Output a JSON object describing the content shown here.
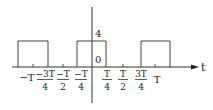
{
  "diagram": {
    "type": "periodic rectangular pulse train",
    "axis": {
      "horizontal_label": "t",
      "amplitude_label": "4",
      "origin_label": "0"
    },
    "tick_labels": [
      {
        "id": "neg_T",
        "whole": "−T"
      },
      {
        "id": "neg_3T_4",
        "num": "−3T",
        "den": "4"
      },
      {
        "id": "neg_T_2",
        "num": "−T",
        "den": "2"
      },
      {
        "id": "neg_T_4",
        "num": "−T",
        "den": "4"
      },
      {
        "id": "T_4",
        "num": "T",
        "den": "4"
      },
      {
        "id": "T_2",
        "num": "T",
        "den": "2"
      },
      {
        "id": "3T_4",
        "num": "3T",
        "den": "4"
      },
      {
        "id": "T",
        "whole": "T"
      }
    ],
    "pulses": [
      {
        "start": "-5T/4",
        "end": "-3T/4",
        "amplitude": 4
      },
      {
        "start": "-T/4",
        "end": "T/4",
        "amplitude": 4
      },
      {
        "start": "3T/4",
        "end": "5T/4",
        "amplitude": 4
      }
    ],
    "colors": {
      "line": "#333333",
      "text": "#222222"
    }
  }
}
